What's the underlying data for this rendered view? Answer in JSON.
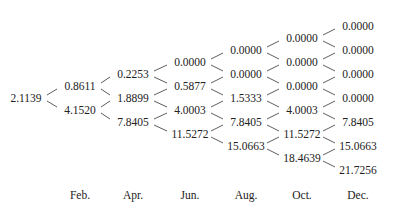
{
  "tree": {
    "columns": [
      {
        "label": "",
        "values": [
          "2.1139"
        ]
      },
      {
        "label": "Feb.",
        "values": [
          "0.8611",
          "4.1520"
        ]
      },
      {
        "label": "Apr.",
        "values": [
          "0.2253",
          "1.8899",
          "7.8405"
        ]
      },
      {
        "label": "Jun.",
        "values": [
          "0.0000",
          "0.5877",
          "4.0003",
          "11.5272"
        ]
      },
      {
        "label": "Aug.",
        "values": [
          "0.0000",
          "0.0000",
          "1.5333",
          "7.8405",
          "15.0663"
        ]
      },
      {
        "label": "Oct.",
        "values": [
          "0.0000",
          "0.0000",
          "0.0000",
          "4.0003",
          "11.5272",
          "18.4639"
        ]
      },
      {
        "label": "Dec.",
        "values": [
          "0.0000",
          "0.0000",
          "0.0000",
          "0.0000",
          "7.8405",
          "15.0663",
          "21.7256"
        ]
      }
    ]
  }
}
